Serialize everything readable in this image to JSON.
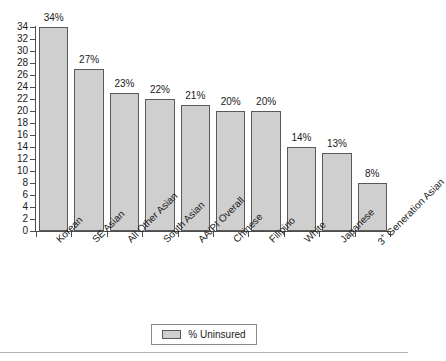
{
  "chart_data": {
    "type": "bar",
    "title": "",
    "subtitle": "",
    "xlabel": "",
    "ylabel": "",
    "ylim": [
      0,
      34
    ],
    "ytick_step": 2,
    "yticks": [
      0,
      2,
      4,
      6,
      8,
      10,
      12,
      14,
      16,
      18,
      20,
      22,
      24,
      26,
      28,
      30,
      32,
      34
    ],
    "grid": false,
    "legend_position": "bottom-center",
    "categories": [
      "Korean",
      "SE Asian",
      "All Other Asian",
      "South Asian",
      "AA/PI Overall",
      "Chinese",
      "Filipino",
      "White",
      "Japanese",
      "3+ Generation Asian"
    ],
    "category_label_html": [
      "Korean",
      "SE Asian",
      "All Other Asian",
      "South Asian",
      "AA/PI Overall",
      "Chinese",
      "Filipino",
      "White",
      "Japanese",
      "3<span class=\"sup\">+</span> Generation Asian"
    ],
    "values": [
      34,
      27,
      23,
      22,
      21,
      20,
      20,
      14,
      13,
      8
    ],
    "value_labels": [
      "34%",
      "27%",
      "23%",
      "22%",
      "21%",
      "20%",
      "20%",
      "14%",
      "13%",
      "8%"
    ],
    "series": [
      {
        "name": "% Uninsured",
        "values": [
          34,
          27,
          23,
          22,
          21,
          20,
          20,
          14,
          13,
          8
        ]
      }
    ],
    "colors": {
      "bar_fill": "#cfcfcf",
      "bar_stroke": "#595959",
      "axis": "#4d4d4d",
      "text": "#1a1a1a",
      "legend_border": "#8c8c8c",
      "rule": "#b3b3b3",
      "background": "#ffffff"
    }
  },
  "legend": {
    "items": [
      {
        "label": "% Uninsured",
        "color": "#cfcfcf"
      }
    ]
  }
}
